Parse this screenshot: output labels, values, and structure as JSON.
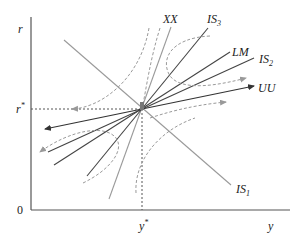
{
  "diagram": {
    "type": "economics-phase-diagram",
    "axes": {
      "y_label": "r",
      "x_label": "y",
      "origin_label": "0",
      "equilibrium_r_label": "r",
      "equilibrium_r_sup": "*",
      "equilibrium_y_label": "y",
      "equilibrium_y_sup": "*"
    },
    "curves": [
      {
        "id": "XX",
        "label": "XX",
        "color": "#9a9a9a"
      },
      {
        "id": "IS3",
        "label": "IS",
        "sub": "3",
        "color": "#444444"
      },
      {
        "id": "LM",
        "label": "LM",
        "color": "#444444"
      },
      {
        "id": "IS2",
        "label": "IS",
        "sub": "2",
        "color": "#444444"
      },
      {
        "id": "UU",
        "label": "UU",
        "color": "#333333"
      },
      {
        "id": "IS1",
        "label": "IS",
        "sub": "1",
        "color": "#9a9a9a"
      }
    ],
    "trajectories_style": "dashed",
    "colors": {
      "axis": "#555555",
      "dark_line": "#444444",
      "light_line": "#9a9a9a",
      "dashed": "#9a9a9a",
      "guide": "#555555"
    }
  }
}
